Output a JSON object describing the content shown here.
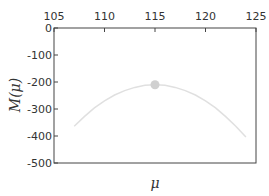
{
  "chart_data": {
    "type": "line",
    "title": "",
    "xlabel": "μ",
    "ylabel": "M(μ)",
    "xlim": [
      105,
      125
    ],
    "ylim": [
      -500,
      0
    ],
    "x_ticks": [
      105,
      110,
      115,
      120,
      125
    ],
    "y_ticks": [
      0,
      -100,
      -200,
      -300,
      -400,
      -500
    ],
    "x_axis_position": "top",
    "grid": false,
    "legend": null,
    "series": [
      {
        "name": "M(μ)",
        "color": "#e0e0e0",
        "x": [
          107,
          108,
          109,
          110,
          111,
          112,
          113,
          114,
          115,
          116,
          117,
          118,
          119,
          120,
          121,
          122,
          123,
          124
        ],
        "values": [
          -364,
          -328,
          -296,
          -270,
          -248,
          -232,
          -220,
          -212,
          -210,
          -212,
          -220,
          -232,
          -248,
          -270,
          -296,
          -328,
          -364,
          -404
        ]
      }
    ],
    "annotations": [
      {
        "type": "marker",
        "x": 115,
        "y": -210,
        "color": "#d0d0d0",
        "label": "maximum"
      }
    ]
  },
  "labels": {
    "xlabel": "μ",
    "ylabel": "M(μ)",
    "x_ticks": [
      "105",
      "110",
      "115",
      "120",
      "125"
    ],
    "y_ticks": [
      "0",
      "-100",
      "-200",
      "-300",
      "-400",
      "-500"
    ]
  }
}
